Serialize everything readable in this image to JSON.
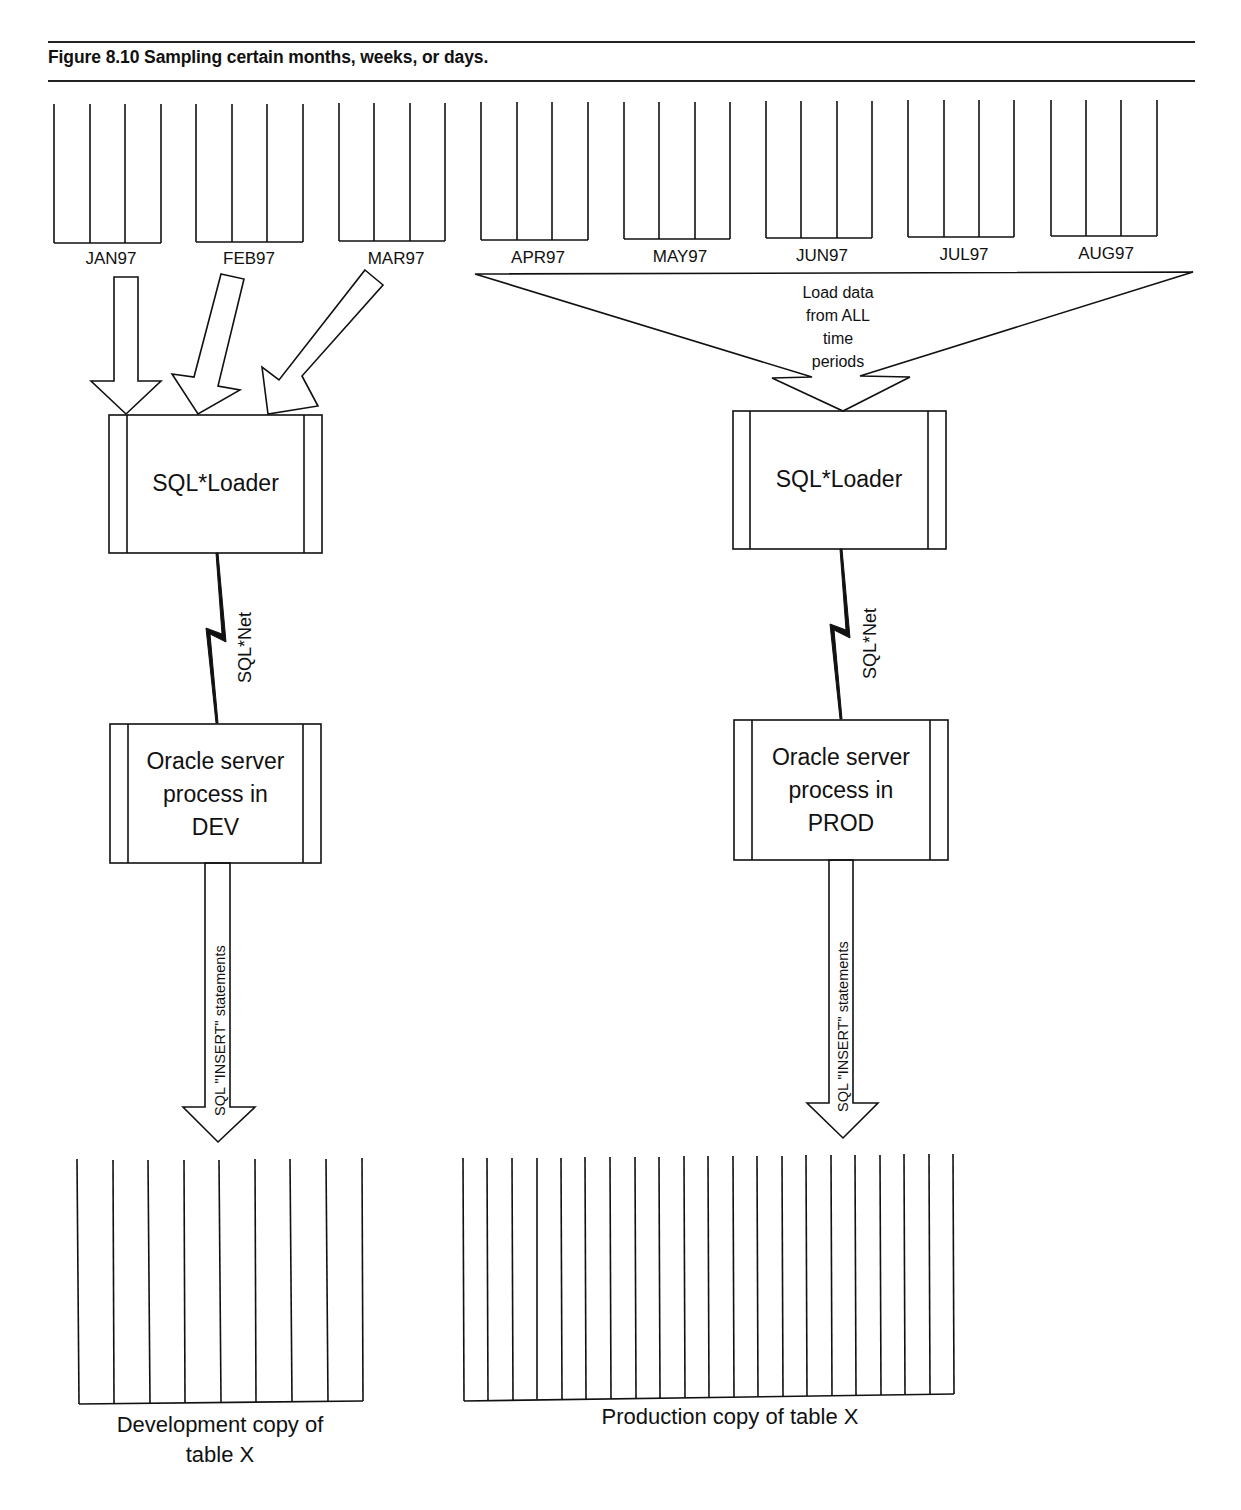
{
  "figure": {
    "caption": "Figure 8.10 Sampling certain months, weeks, or days."
  },
  "source_periods": [
    {
      "label": "JAN97",
      "sampled": true
    },
    {
      "label": "FEB97",
      "sampled": true
    },
    {
      "label": "MAR97",
      "sampled": true
    },
    {
      "label": "APR97",
      "sampled": false
    },
    {
      "label": "MAY97",
      "sampled": false
    },
    {
      "label": "JUN97",
      "sampled": false
    },
    {
      "label": "JUL97",
      "sampled": false
    },
    {
      "label": "AUG97",
      "sampled": false
    }
  ],
  "dev_path": {
    "loader_label": "SQL*Loader",
    "network_label": "SQL*Net",
    "server_label_lines": [
      "Oracle server",
      "process in",
      "DEV"
    ],
    "insert_label": "SQL \"INSERT\" statements",
    "target_label_lines": [
      "Development copy of",
      "table X"
    ],
    "target_columns": 8
  },
  "prod_path": {
    "funnel_label_lines": [
      "Load data",
      "from ALL",
      "time",
      "periods"
    ],
    "loader_label": "SQL*Loader",
    "network_label": "SQL*Net",
    "server_label_lines": [
      "Oracle server",
      "process in",
      "PROD"
    ],
    "insert_label": "SQL \"INSERT\" statements",
    "target_label": "Production copy of table X",
    "target_columns": 20
  }
}
